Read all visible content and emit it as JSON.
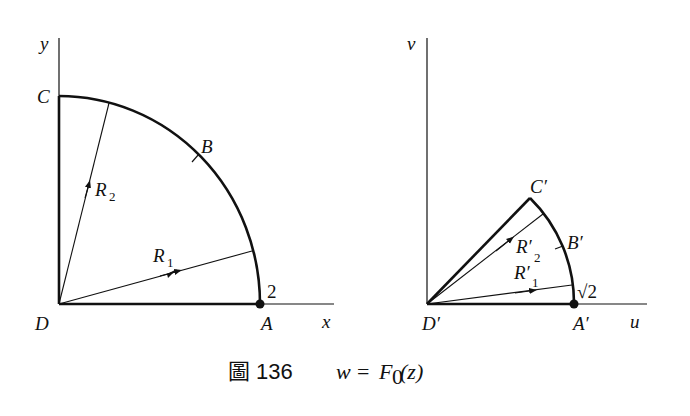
{
  "figure": {
    "caption": {
      "prefix": "圖 136",
      "formula_lhs": "w",
      "formula_eq": "=",
      "formula_func": "F",
      "formula_sub": "0",
      "formula_arg": "(z)"
    },
    "left_panel": {
      "plane": "z",
      "axes": {
        "x_label": "x",
        "y_label": "y"
      },
      "points": {
        "A": "A",
        "B": "B",
        "C": "C",
        "D": "D"
      },
      "radius_label": "2",
      "paths": {
        "R1": {
          "name": "R",
          "sub": "1"
        },
        "R2": {
          "name": "R",
          "sub": "2"
        }
      },
      "region": "quarter disk of radius 2 in first quadrant"
    },
    "right_panel": {
      "plane": "w",
      "axes": {
        "x_label": "u",
        "y_label": "v"
      },
      "points": {
        "A": "A′",
        "B": "B′",
        "C": "C′",
        "D": "D′"
      },
      "radius_label": "√2",
      "paths": {
        "R1": {
          "name": "R′",
          "sub": "1"
        },
        "R2": {
          "name": "R′",
          "sub": "2"
        }
      },
      "region": "circular sector of radius √2, angle π/4"
    },
    "colors": {
      "ink": "#111111",
      "background": "#ffffff"
    }
  }
}
